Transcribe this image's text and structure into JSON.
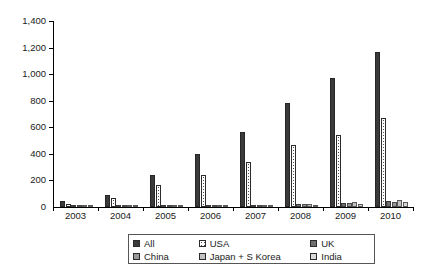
{
  "chart_data": {
    "type": "bar",
    "title": "",
    "subtitle": "",
    "xlabel": "",
    "ylabel": "",
    "categories": [
      "2003",
      "2004",
      "2005",
      "2006",
      "2007",
      "2008",
      "2009",
      "2010"
    ],
    "ylim": [
      0,
      1400
    ],
    "yticks": [
      0,
      200,
      400,
      600,
      800,
      1000,
      1200,
      1400
    ],
    "ytick_labels": [
      "0",
      "200",
      "400",
      "600",
      "800",
      "1,000",
      "1,200",
      "1,400"
    ],
    "grid": false,
    "legend_position": "bottom",
    "series": [
      {
        "name": "All",
        "key": "sw-all",
        "color": "#3a3a3a",
        "values": [
          42,
          88,
          240,
          400,
          565,
          783,
          970,
          1167
        ]
      },
      {
        "name": "USA",
        "key": "sw-usa",
        "color": "#ffffff",
        "values": [
          24,
          70,
          165,
          240,
          340,
          466,
          540,
          670
        ]
      },
      {
        "name": "UK",
        "key": "sw-uk",
        "color": "#6e6e6e",
        "values": [
          2,
          3,
          8,
          12,
          18,
          26,
          32,
          42
        ]
      },
      {
        "name": "China",
        "key": "sw-china",
        "color": "#9a9a9a",
        "values": [
          1,
          2,
          6,
          9,
          14,
          22,
          30,
          38
        ]
      },
      {
        "name": "Japan + S Korea",
        "key": "sw-japan",
        "color": "#c2c2c2",
        "values": [
          1,
          2,
          5,
          8,
          12,
          20,
          38,
          52
        ]
      },
      {
        "name": "India",
        "key": "sw-india",
        "color": "#d8d8d8",
        "values": [
          1,
          1,
          3,
          5,
          9,
          16,
          24,
          34
        ]
      }
    ]
  },
  "axes": {
    "y_ticks": [
      {
        "label": "1,400",
        "value": 1400
      },
      {
        "label": "1,200",
        "value": 1200
      },
      {
        "label": "1,000",
        "value": 1000
      },
      {
        "label": "800",
        "value": 800
      },
      {
        "label": "600",
        "value": 600
      },
      {
        "label": "400",
        "value": 400
      },
      {
        "label": "200",
        "value": 200
      },
      {
        "label": "0",
        "value": 0
      }
    ],
    "x_labels": [
      "2003",
      "2004",
      "2005",
      "2006",
      "2007",
      "2008",
      "2009",
      "2010"
    ]
  },
  "legend": {
    "rows": [
      [
        {
          "name": "All",
          "key": "sw-all"
        },
        {
          "name": "USA",
          "key": "sw-usa"
        },
        {
          "name": "UK",
          "key": "sw-uk"
        }
      ],
      [
        {
          "name": "China",
          "key": "sw-china"
        },
        {
          "name": "Japan + S Korea",
          "key": "sw-japan"
        },
        {
          "name": "India",
          "key": "sw-india"
        }
      ]
    ]
  }
}
